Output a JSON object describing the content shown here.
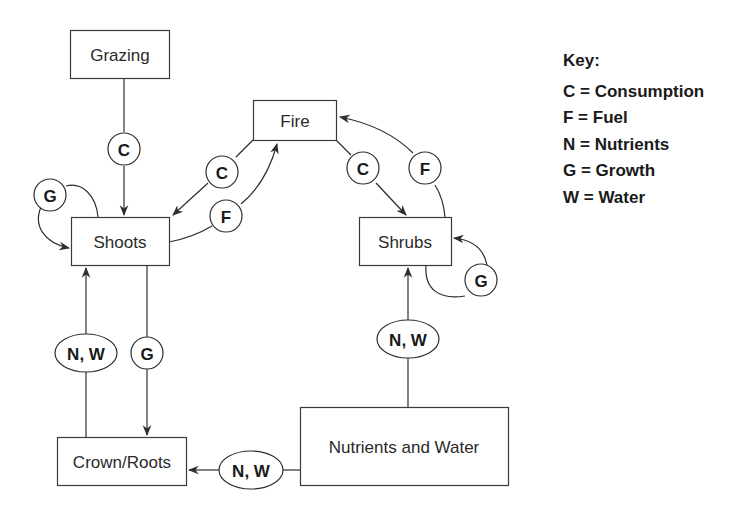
{
  "nodes": {
    "grazing": "Grazing",
    "shoots": "Shoots",
    "fire": "Fire",
    "shrubs": "Shrubs",
    "crown_roots": "Crown/Roots",
    "nutrients_water": "Nutrients and Water"
  },
  "edges": [
    {
      "from": "Grazing",
      "to": "Shoots",
      "label": "C"
    },
    {
      "from": "Shoots",
      "to": "Shoots",
      "label": "G"
    },
    {
      "from": "Fire",
      "to": "Shoots",
      "label": "C"
    },
    {
      "from": "Shoots",
      "to": "Fire",
      "label": "F"
    },
    {
      "from": "Fire",
      "to": "Shrubs",
      "label": "C"
    },
    {
      "from": "Shrubs",
      "to": "Fire",
      "label": "F"
    },
    {
      "from": "Shrubs",
      "to": "Shrubs",
      "label": "G"
    },
    {
      "from": "Crown/Roots",
      "to": "Shoots",
      "label": "N, W"
    },
    {
      "from": "Shoots",
      "to": "Crown/Roots",
      "label": "G"
    },
    {
      "from": "Nutrients and Water",
      "to": "Shrubs",
      "label": "N, W"
    },
    {
      "from": "Nutrients and Water",
      "to": "Crown/Roots",
      "label": "N, W"
    }
  ],
  "labels": {
    "grazing_shoots": "C",
    "shoots_self": "G",
    "fire_shoots": "C",
    "shoots_fire": "F",
    "fire_shrubs": "C",
    "shrubs_fire": "F",
    "shrubs_self": "G",
    "roots_shoots": "N, W",
    "shoots_roots": "G",
    "nw_shrubs": "N, W",
    "nw_roots": "N, W"
  },
  "key": {
    "title": "Key:",
    "items": [
      "C = Consumption",
      "F = Fuel",
      "N = Nutrients",
      "G = Growth",
      "W = Water"
    ]
  }
}
